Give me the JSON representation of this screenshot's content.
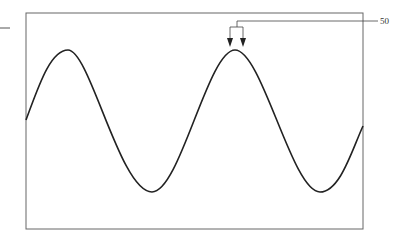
{
  "figure": {
    "type": "patent-style line drawing",
    "reference_label": "50",
    "colors": {
      "frame": "#555555",
      "wave": "#222222",
      "leader": "#444444",
      "background": "#ffffff"
    },
    "frame": {
      "x": 26,
      "y": 13,
      "width": 337,
      "height": 216
    },
    "wave": {
      "start": {
        "x": 26,
        "y": 120
      },
      "peaks": [
        {
          "x": 68,
          "y": 50
        },
        {
          "x": 235,
          "y": 50
        }
      ],
      "troughs": [
        {
          "x": 152,
          "y": 192
        },
        {
          "x": 320,
          "y": 192
        }
      ],
      "end": {
        "x": 363,
        "y": 126
      }
    },
    "left_tick": {
      "x1": 0,
      "x2": 10,
      "y": 28
    }
  }
}
